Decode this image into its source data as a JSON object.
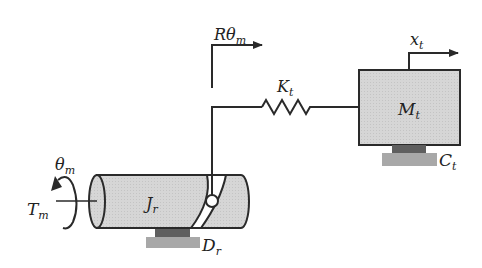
{
  "diagram": {
    "labels": {
      "motor_torque": {
        "main": "T",
        "sub": "m"
      },
      "motor_angle": {
        "main": "θ",
        "sub": "m"
      },
      "rotor_inertia": {
        "main": "J",
        "sub": "r"
      },
      "rotor_damping": {
        "main": "D",
        "sub": "r"
      },
      "pin_displacement": {
        "main": "Rθ",
        "sub": "m"
      },
      "spring_stiffness": {
        "main": "K",
        "sub": "t"
      },
      "mass": {
        "main": "M",
        "sub": "t"
      },
      "mass_damping": {
        "main": "C",
        "sub": "t"
      },
      "mass_displacement": {
        "main": "x",
        "sub": "t"
      }
    },
    "colors": {
      "body_fill": "#d4d4d4",
      "stroke": "#2a2a2a",
      "damper_dark": "#5f5f5f",
      "damper_light": "#a8a8a8",
      "background": "#ffffff"
    }
  }
}
